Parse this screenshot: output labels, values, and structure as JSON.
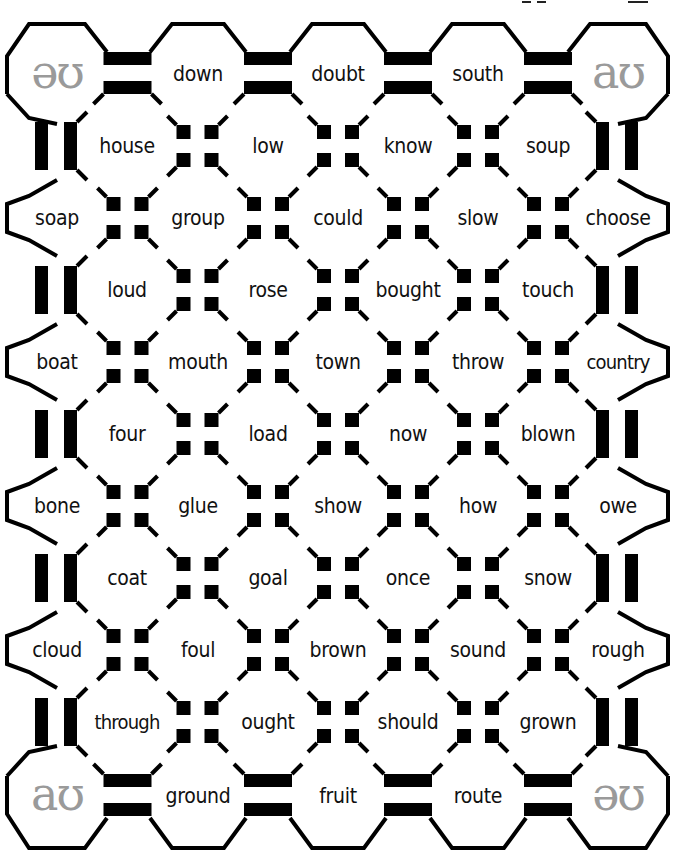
{
  "game": {
    "type": "phoneme-maze-board",
    "colors": {
      "line": "#000000",
      "background": "#ffffff",
      "sound_symbol": "#9a9a9a",
      "text": "#111111"
    }
  },
  "corner_sounds": {
    "top_left": "əʊ",
    "top_right": "aʊ",
    "bottom_left": "aʊ",
    "bottom_right": "əʊ"
  },
  "rows": [
    {
      "type": "outer",
      "cells": [
        "",
        "down",
        "doubt",
        "south",
        ""
      ]
    },
    {
      "type": "inner",
      "cells": [
        "house",
        "low",
        "know",
        "soup"
      ]
    },
    {
      "type": "outer",
      "cells": [
        "soap",
        "group",
        "could",
        "slow",
        "choose"
      ]
    },
    {
      "type": "inner",
      "cells": [
        "loud",
        "rose",
        "bought",
        "touch"
      ]
    },
    {
      "type": "outer",
      "cells": [
        "boat",
        "mouth",
        "town",
        "throw",
        "country"
      ]
    },
    {
      "type": "inner",
      "cells": [
        "four",
        "load",
        "now",
        "blown"
      ]
    },
    {
      "type": "outer",
      "cells": [
        "bone",
        "glue",
        "show",
        "how",
        "owe"
      ]
    },
    {
      "type": "inner",
      "cells": [
        "coat",
        "goal",
        "once",
        "snow"
      ]
    },
    {
      "type": "outer",
      "cells": [
        "cloud",
        "foul",
        "brown",
        "sound",
        "rough"
      ]
    },
    {
      "type": "inner",
      "cells": [
        "through",
        "ought",
        "should",
        "grown"
      ]
    },
    {
      "type": "outer",
      "cells": [
        "",
        "ground",
        "fruit",
        "route",
        ""
      ]
    }
  ],
  "layout": {
    "outer_x": [
      57,
      198,
      338,
      478,
      618
    ],
    "inner_x": [
      127,
      268,
      408,
      548
    ],
    "row_y": [
      74,
      146,
      218,
      290,
      362,
      434,
      506,
      578,
      650,
      722,
      796
    ]
  }
}
